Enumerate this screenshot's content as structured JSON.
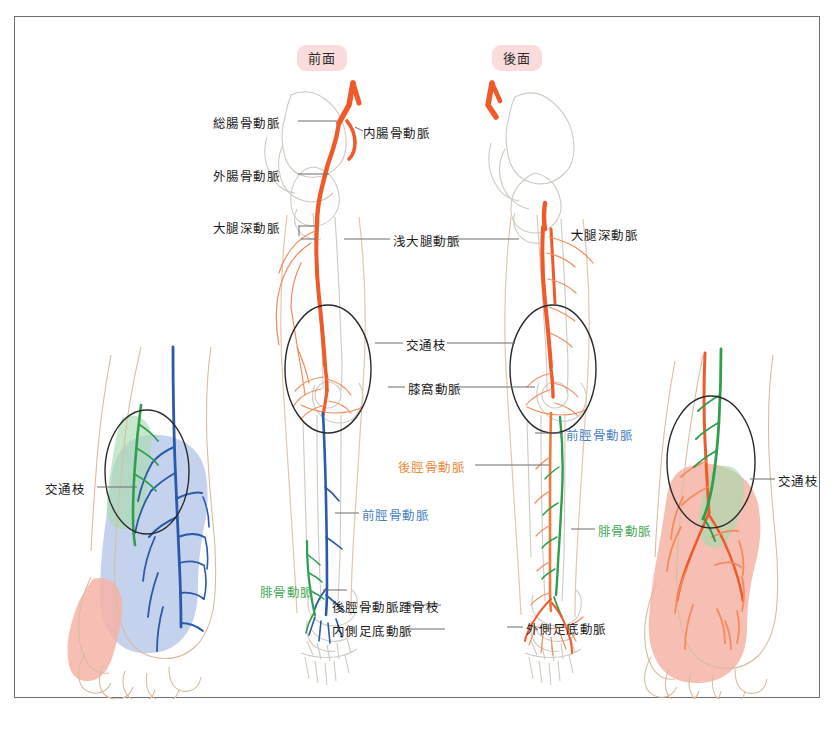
{
  "figure": {
    "views": {
      "anterior_badge": "前面",
      "posterior_badge": "後面"
    }
  },
  "labels": {
    "common_iliac": "総腸骨動脈",
    "internal_iliac": "内腸骨動脈",
    "external_iliac": "外腸骨動脈",
    "deep_femoral_left": "大腿深動脈",
    "deep_femoral_right": "大腿深動脈",
    "superficial_femoral": "浅大腿動脈",
    "communicating_branch_center": "交通枝",
    "popliteal": "膝窩動脈",
    "anterior_tibial_upper": "前脛骨動脈",
    "posterior_tibial": "後脛骨動脈",
    "peroneal_right": "腓骨動脈",
    "anterior_tibial_lower": "前脛骨動脈",
    "peroneal_left": "腓骨動脈",
    "calcaneal_branch": "後脛骨動脈踵骨枝",
    "medial_plantar": "内側足底動脈",
    "lateral_plantar": "外側足底動脈",
    "communicating_branch_leftfoot": "交通枝",
    "communicating_branch_rightfoot": "交通枝"
  },
  "colors": {
    "artery_orange": "#f05a28",
    "anterior_tibial_blue": "#2a5aa8",
    "peroneal_green": "#2f9e4f",
    "posterior_tibial_orange": "#ea8a3c",
    "territory_blue": "#aec0e8",
    "territory_pink": "#f6b3a6",
    "territory_green": "#a9dcb0",
    "badge_bg": "#fbdcdc",
    "frame_border": "#6f6f6f",
    "label_text": "#1b1b1b"
  }
}
